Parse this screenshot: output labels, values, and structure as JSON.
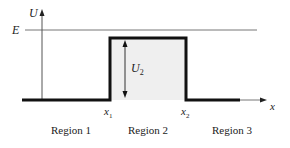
{
  "diagram": {
    "axes": {
      "y_label": "U",
      "x_label": "x"
    },
    "energy_line": {
      "label": "E"
    },
    "barrier": {
      "height_label_main": "U",
      "height_label_sub": "2",
      "fill": "#efefef",
      "stroke": "#111111"
    },
    "positions": {
      "x1_main": "x",
      "x1_sub": "1",
      "x2_main": "x",
      "x2_sub": "2"
    },
    "regions": [
      {
        "label": "Region 1"
      },
      {
        "label": "Region 2"
      },
      {
        "label": "Region 3"
      }
    ]
  }
}
